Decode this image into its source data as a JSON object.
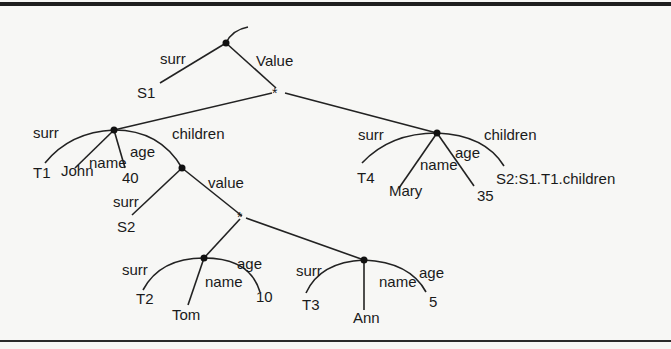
{
  "diagram": {
    "type": "object-tree",
    "root": {
      "labels": {
        "surr": "surr",
        "value": "Value"
      },
      "surrogate": "S1"
    },
    "set_marker": "*",
    "person_t1": {
      "edge_labels": {
        "surr": "surr",
        "name": "name",
        "age": "age",
        "children": "children"
      },
      "surrogate": "T1",
      "name": "John",
      "age": "40"
    },
    "children_set": {
      "edge_labels": {
        "surr": "surr",
        "value": "value"
      },
      "surrogate": "S2",
      "set_marker": "*"
    },
    "person_t2": {
      "edge_labels": {
        "surr": "surr",
        "name": "name",
        "age": "age"
      },
      "surrogate": "T2",
      "name": "Tom",
      "age": "10"
    },
    "person_t3": {
      "edge_labels": {
        "surr": "surr",
        "name": "name",
        "age": "age"
      },
      "surrogate": "T3",
      "name": "Ann",
      "age": "5"
    },
    "person_t4": {
      "edge_labels": {
        "surr": "surr",
        "name": "name",
        "age": "age",
        "children": "children"
      },
      "surrogate": "T4",
      "name": "Mary",
      "age": "35",
      "children_ref": "S2:S1.T1.children"
    }
  }
}
